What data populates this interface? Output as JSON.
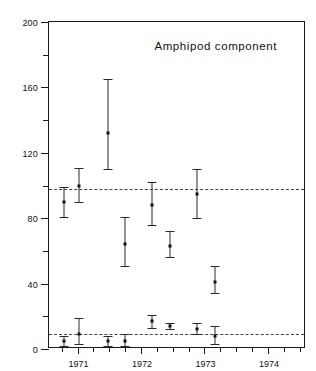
{
  "chart_data": {
    "type": "scatter",
    "title": "Amphipod component",
    "xlabel": "",
    "ylabel": "Geometric mean dry weight (mgm)/0.04 M",
    "ylabel_exponent": "2",
    "ylim": [
      0,
      200
    ],
    "xlim": [
      1970.55,
      1974.6
    ],
    "grid": false,
    "legend": null,
    "y_ticks_major": [
      0,
      40,
      80,
      120,
      160,
      200
    ],
    "y_ticks_minor": [
      20,
      60,
      100,
      140,
      180
    ],
    "x_ticks_major": [
      1971,
      1972,
      1973,
      1974
    ],
    "x_tick_labels": [
      "1971",
      "1972",
      "1973",
      "1974"
    ],
    "x_ticks_minor": [
      1970.75,
      1971.25,
      1971.5,
      1971.75,
      1972.25,
      1972.5,
      1972.75,
      1973.25,
      1973.5,
      1973.75,
      1974.25,
      1974.5
    ],
    "reference_lines": [
      {
        "name": "upper-mean-line",
        "y": 98,
        "style": "dashed"
      },
      {
        "name": "lower-mean-line",
        "y": 9,
        "style": "dashed"
      }
    ],
    "series": [
      {
        "name": "upper-series",
        "marker": "square",
        "points": [
          {
            "x": 1970.78,
            "y": 90,
            "y_low": 81,
            "y_high": 99
          },
          {
            "x": 1971.03,
            "y": 100,
            "y_low": 90,
            "y_high": 111
          },
          {
            "x": 1971.48,
            "y": 132,
            "y_low": 110,
            "y_high": 165
          },
          {
            "x": 1971.75,
            "y": 64,
            "y_low": 51,
            "y_high": 81
          },
          {
            "x": 1972.18,
            "y": 88,
            "y_low": 76,
            "y_high": 102
          },
          {
            "x": 1972.46,
            "y": 63,
            "y_low": 56,
            "y_high": 72
          },
          {
            "x": 1972.89,
            "y": 95,
            "y_low": 80,
            "y_high": 110
          },
          {
            "x": 1973.17,
            "y": 41,
            "y_low": 34,
            "y_high": 51
          }
        ]
      },
      {
        "name": "lower-series",
        "marker": "square",
        "points": [
          {
            "x": 1970.78,
            "y": 5,
            "y_low": 2,
            "y_high": 8
          },
          {
            "x": 1971.03,
            "y": 9,
            "y_low": 3,
            "y_high": 19
          },
          {
            "x": 1971.48,
            "y": 5,
            "y_low": 2,
            "y_high": 8
          },
          {
            "x": 1971.75,
            "y": 5,
            "y_low": 2,
            "y_high": 9
          },
          {
            "x": 1972.18,
            "y": 17,
            "y_low": 13,
            "y_high": 21
          },
          {
            "x": 1972.46,
            "y": 14,
            "y_low": 12,
            "y_high": 16
          },
          {
            "x": 1972.89,
            "y": 12,
            "y_low": 9,
            "y_high": 16
          },
          {
            "x": 1973.17,
            "y": 8,
            "y_low": 3,
            "y_high": 14
          }
        ]
      }
    ]
  }
}
